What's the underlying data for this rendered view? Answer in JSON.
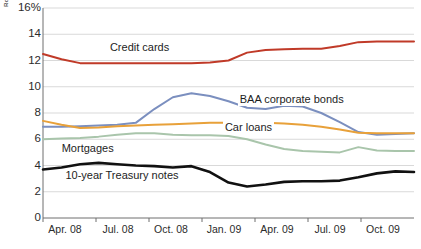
{
  "credit": {
    "text": "Robert Hall/The Federal Reserve Bank of Minneapolis"
  },
  "chart_data": {
    "type": "line",
    "title": "",
    "subtitle": "",
    "xlabel": "",
    "ylabel": "",
    "y_axis_unit_label": "16%",
    "ylim": [
      0,
      16
    ],
    "yticks": [
      0,
      2,
      4,
      6,
      8,
      10,
      12,
      14,
      16
    ],
    "ytick_labels": [
      "0",
      "2",
      "4",
      "6",
      "8",
      "10",
      "12",
      "14",
      "16%"
    ],
    "grid": true,
    "grid_axis": "y",
    "legend_position": "inline-annotations",
    "x": [
      "Apr. 08",
      "May 08",
      "Jun. 08",
      "Jul. 08",
      "Aug. 08",
      "Sep. 08",
      "Oct. 08",
      "Nov. 08",
      "Dec. 08",
      "Jan. 09",
      "Feb. 09",
      "Mar. 09",
      "Apr. 09",
      "May 09",
      "Jun. 09",
      "Jul. 09",
      "Aug. 09",
      "Sep. 09",
      "Oct. 09",
      "Nov. 09",
      "Dec. 09"
    ],
    "xticks": [
      "Apr. 08",
      "Jul. 08",
      "Oct. 08",
      "Jan. 09",
      "Apr. 09",
      "Jul. 09",
      "Oct. 09"
    ],
    "series": [
      {
        "name": "Credit cards",
        "color": "#C03A28",
        "label_x_frac": 0.175,
        "label_y_value": 13.05,
        "values": [
          12.5,
          12.1,
          11.8,
          11.8,
          11.8,
          11.8,
          11.8,
          11.8,
          11.8,
          11.85,
          12.0,
          12.6,
          12.8,
          12.85,
          12.9,
          12.9,
          13.1,
          13.4,
          13.45,
          13.45,
          13.45
        ]
      },
      {
        "name": "BAA corporate bonds",
        "color": "#7B8FBF",
        "label_x_frac": 0.525,
        "label_y_value": 9.05,
        "values": [
          6.95,
          6.95,
          7.0,
          7.05,
          7.1,
          7.25,
          8.3,
          9.2,
          9.5,
          9.3,
          8.9,
          8.4,
          8.3,
          8.55,
          8.5,
          8.0,
          7.3,
          6.55,
          6.35,
          6.4,
          6.45
        ]
      },
      {
        "name": "Car loans",
        "color": "#E8A13A",
        "label_x_frac": 0.485,
        "label_y_value": 6.9,
        "values": [
          7.4,
          7.1,
          6.85,
          6.9,
          7.0,
          7.05,
          7.1,
          7.15,
          7.2,
          7.25,
          7.25,
          7.25,
          7.25,
          7.2,
          7.1,
          6.95,
          6.75,
          6.5,
          6.45,
          6.45,
          6.45
        ]
      },
      {
        "name": "Mortgages",
        "color": "#A9C5AB",
        "label_x_frac": 0.045,
        "label_y_value": 5.3,
        "values": [
          6.0,
          6.05,
          6.1,
          6.2,
          6.35,
          6.45,
          6.45,
          6.35,
          6.3,
          6.3,
          6.25,
          6.0,
          5.6,
          5.25,
          5.1,
          5.05,
          5.0,
          5.4,
          5.15,
          5.1,
          5.1
        ]
      },
      {
        "name": "10-year Treasury notes",
        "color": "#111111",
        "label_x_frac": 0.055,
        "label_y_value": 3.25,
        "values": [
          3.7,
          3.85,
          4.1,
          4.2,
          4.1,
          4.0,
          3.95,
          3.85,
          3.95,
          3.5,
          2.7,
          2.4,
          2.55,
          2.75,
          2.8,
          2.8,
          2.85,
          3.1,
          3.4,
          3.55,
          3.5
        ]
      }
    ]
  }
}
